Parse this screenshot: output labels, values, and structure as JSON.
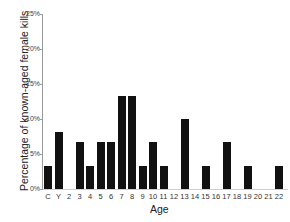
{
  "chart_data": {
    "type": "bar",
    "title": "",
    "xlabel": "Age",
    "ylabel": "Percentage of known-aged female kills",
    "ylim": [
      0,
      25
    ],
    "yticks": [
      "0%",
      "5%",
      "10%",
      "15%",
      "20%",
      "25%"
    ],
    "grid": false,
    "legend": null,
    "categories": [
      "C",
      "Y",
      "2",
      "3",
      "4",
      "5",
      "6",
      "7",
      "8",
      "9",
      "10",
      "11",
      "12",
      "13",
      "14",
      "15",
      "16",
      "17",
      "18",
      "19",
      "20",
      "21",
      "22"
    ],
    "values": [
      3.3,
      8.1,
      0,
      6.7,
      3.3,
      6.7,
      6.7,
      13.3,
      13.3,
      3.3,
      6.7,
      3.3,
      0,
      10.0,
      0,
      3.3,
      0,
      6.7,
      0,
      3.3,
      0,
      0,
      3.3
    ],
    "bar_color": "#111111"
  }
}
